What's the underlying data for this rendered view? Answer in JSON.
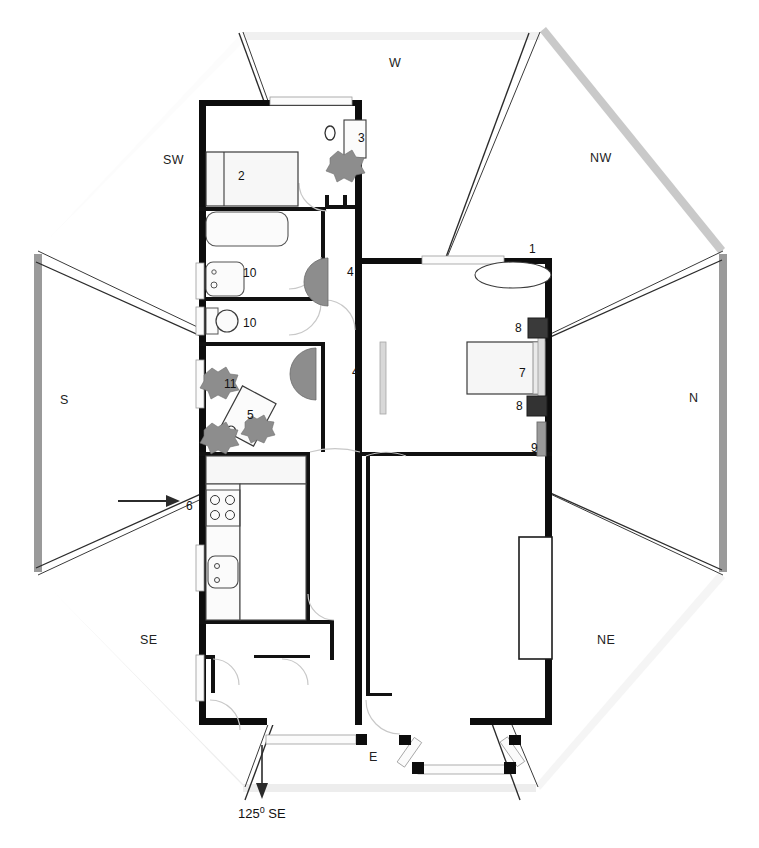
{
  "diagram": {
    "orientation_note": "125° SE",
    "orientation_degrees": "125",
    "orientation_suffix": "SE"
  },
  "compass": {
    "labels": [
      {
        "id": "w",
        "text": "W",
        "x": 389,
        "y": 63
      },
      {
        "id": "nw",
        "text": "NW",
        "x": 590,
        "y": 158
      },
      {
        "id": "n",
        "text": "N",
        "x": 689,
        "y": 398
      },
      {
        "id": "ne",
        "text": "NE",
        "x": 597,
        "y": 640
      },
      {
        "id": "e",
        "text": "E",
        "x": 369,
        "y": 757
      },
      {
        "id": "se",
        "text": "SE",
        "x": 140,
        "y": 640
      },
      {
        "id": "s",
        "text": "S",
        "x": 60,
        "y": 400
      },
      {
        "id": "sw",
        "text": "SW",
        "x": 163,
        "y": 160
      }
    ]
  },
  "rooms": {
    "markers": [
      {
        "id": "m1",
        "text": "1",
        "x": 529,
        "y": 248,
        "room": "living-room"
      },
      {
        "id": "m2",
        "text": "2",
        "x": 238,
        "y": 175,
        "room": "bedroom-bed"
      },
      {
        "id": "m3",
        "text": "3",
        "x": 358,
        "y": 137,
        "room": "bedroom-wardrobe"
      },
      {
        "id": "m4a",
        "text": "4",
        "x": 347,
        "y": 271,
        "room": "hall-upper"
      },
      {
        "id": "m4b",
        "text": "4",
        "x": 352,
        "y": 371,
        "room": "hall-lower"
      },
      {
        "id": "m5",
        "text": "5",
        "x": 247,
        "y": 414,
        "room": "dining-table"
      },
      {
        "id": "m6",
        "text": "6",
        "x": 186,
        "y": 505,
        "room": "kitchen-entry"
      },
      {
        "id": "m7",
        "text": "7",
        "x": 519,
        "y": 372,
        "room": "sofa"
      },
      {
        "id": "m8a",
        "text": "8",
        "x": 515,
        "y": 327,
        "room": "armchair-upper"
      },
      {
        "id": "m8b",
        "text": "8",
        "x": 516,
        "y": 405,
        "room": "armchair-lower"
      },
      {
        "id": "m9",
        "text": "9",
        "x": 531,
        "y": 447,
        "room": "sideboard"
      },
      {
        "id": "m10a",
        "text": "10",
        "x": 246,
        "y": 272,
        "room": "bathroom-upper"
      },
      {
        "id": "m10b",
        "text": "10",
        "x": 246,
        "y": 322,
        "room": "bathroom-lower"
      },
      {
        "id": "m11",
        "text": "11",
        "x": 227,
        "y": 383,
        "room": "plant-corner"
      }
    ]
  },
  "colors": {
    "wall": "#0d0d0d",
    "thin_wall": "#1a1a1a",
    "furniture_stroke": "#555555",
    "furniture_fill": "#f7f7f7",
    "plant": "#8d8d8d",
    "glazing_band": "#f2f2f2",
    "sun_ray": "#3a3a3a",
    "frame_dark": "#8e8e8e",
    "frame_light": "#e8e8e8",
    "construction": "#e3e3e3",
    "door_swing": "#cfcfcf"
  }
}
